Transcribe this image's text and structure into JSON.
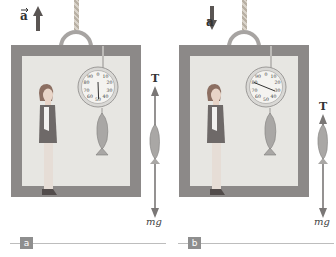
{
  "panels": [
    {
      "id": "a",
      "caption": "a",
      "acceleration": {
        "label": "a",
        "direction": "up"
      },
      "scale_reading": 50,
      "force_labels": {
        "tension": "T",
        "weight": "mg"
      },
      "dial_numbers": [
        "0",
        "10",
        "20",
        "30",
        "40",
        "50",
        "60",
        "70",
        "80",
        "90"
      ]
    },
    {
      "id": "b",
      "caption": "b",
      "acceleration": {
        "label": "a",
        "direction": "down"
      },
      "scale_reading": 30,
      "force_labels": {
        "tension": "T",
        "weight": "mg"
      },
      "dial_numbers": [
        "0",
        "10",
        "20",
        "30",
        "40",
        "50",
        "60",
        "70",
        "80",
        "90"
      ]
    }
  ],
  "colors": {
    "elevator_frame": "#8c8988",
    "elevator_interior": "#e7e6e2",
    "arrow": "#7a7776",
    "accel_arrow": "#5a5553",
    "badge": "#8e8e8e"
  }
}
